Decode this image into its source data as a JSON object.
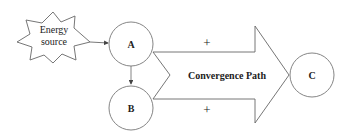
{
  "diagram": {
    "energy_source": {
      "line1": "Energy",
      "line2": "source"
    },
    "nodes": {
      "a": "A",
      "b": "B",
      "c": "C"
    },
    "convergence_path": "Convergence Path",
    "plus_top": "+",
    "plus_bottom": "+",
    "colors": {
      "stroke": "#555555",
      "text": "#222222",
      "background": "#ffffff"
    }
  }
}
